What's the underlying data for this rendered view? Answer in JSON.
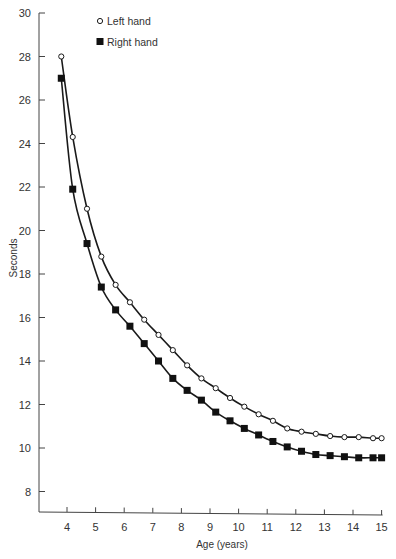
{
  "chart_data": {
    "type": "line",
    "title": "",
    "xlabel": "Age (years)",
    "ylabel": "Seconds",
    "xlim": [
      3,
      15
    ],
    "ylim": [
      7,
      30
    ],
    "x_ticks": [
      4,
      5,
      6,
      7,
      8,
      9,
      10,
      11,
      12,
      13,
      14,
      15
    ],
    "y_ticks": [
      8,
      10,
      12,
      14,
      16,
      18,
      20,
      22,
      24,
      26,
      28,
      30
    ],
    "grid": false,
    "legend_position": "upper center",
    "x": [
      3.8,
      4.2,
      4.7,
      5.2,
      5.7,
      6.2,
      6.7,
      7.2,
      7.7,
      8.2,
      8.7,
      9.2,
      9.7,
      10.2,
      10.7,
      11.2,
      11.7,
      12.2,
      12.7,
      13.2,
      13.7,
      14.2,
      14.7,
      15.0
    ],
    "series": [
      {
        "name": "Left hand",
        "marker": "open-circle",
        "values": [
          28.0,
          24.3,
          21.0,
          18.8,
          17.5,
          16.7,
          15.9,
          15.2,
          14.5,
          13.8,
          13.2,
          12.75,
          12.3,
          11.9,
          11.55,
          11.25,
          10.9,
          10.75,
          10.65,
          10.55,
          10.5,
          10.5,
          10.45,
          10.45
        ]
      },
      {
        "name": "Right hand",
        "marker": "filled-square",
        "values": [
          27.0,
          21.9,
          19.4,
          17.4,
          16.35,
          15.6,
          14.8,
          14.0,
          13.2,
          12.65,
          12.2,
          11.65,
          11.25,
          10.9,
          10.6,
          10.3,
          10.05,
          9.85,
          9.7,
          9.65,
          9.6,
          9.55,
          9.55,
          9.55
        ]
      }
    ]
  },
  "colors": {
    "line": "#1a1a1a",
    "axis": "#444444",
    "text": "#333333",
    "background": "#ffffff"
  }
}
